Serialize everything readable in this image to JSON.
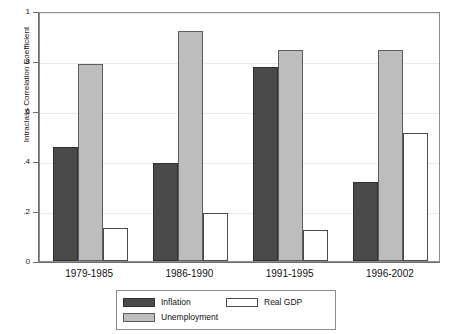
{
  "chart_data": {
    "type": "bar",
    "title": "",
    "subtitle": "",
    "xlabel": "",
    "ylabel": "Intraclass Correlation Coefficient",
    "categories": [
      "1979-1985",
      "1986-1990",
      "1991-1995",
      "1996-2002"
    ],
    "series": [
      {
        "name": "Inflation",
        "color": "#4a4a4a",
        "values": [
          0.455,
          0.392,
          0.775,
          0.315
        ]
      },
      {
        "name": "Unemployment",
        "color": "#bdbdbd",
        "values": [
          0.79,
          0.92,
          0.845,
          0.845
        ]
      },
      {
        "name": "Real GDP",
        "color": "#ffffff",
        "values": [
          0.132,
          0.193,
          0.123,
          0.512
        ]
      }
    ],
    "ylim": [
      0,
      1
    ],
    "yticks": [
      "0",
      ".2",
      ".4",
      ".6",
      ".8",
      "1"
    ],
    "ytick_values": [
      0,
      0.2,
      0.4,
      0.6,
      0.8,
      1
    ],
    "grid": "horizontal",
    "legend_position": "bottom-center",
    "legend_entries": [
      "Inflation",
      "Unemployment",
      "Real GDP"
    ]
  },
  "legend": {
    "inflation_label": "Inflation",
    "unemployment_label": "Unemployment",
    "realgdp_label": "Real GDP"
  }
}
